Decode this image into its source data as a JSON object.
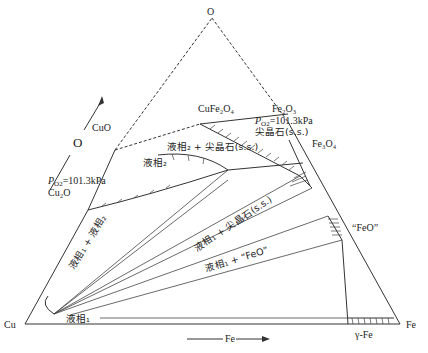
{
  "diagram": {
    "type": "ternary phase diagram",
    "vertices": {
      "top": "O",
      "left": "Cu",
      "right": "Fe"
    },
    "axis_arrows": {
      "left_side": "O",
      "bottom": "Fe"
    },
    "compounds": {
      "cuo": "CuO",
      "cu2o": "Cu₂O",
      "cufe2o4": "CuFe₂O₄",
      "fe2o3": "Fe₂O₃",
      "fe3o4": "Fe₃O₄",
      "feo": "“FeO”",
      "gamma_fe": "γ-Fe"
    },
    "pressure_labels": {
      "left": "P_O2=101.3kPa",
      "left_p": "P",
      "left_sub": "O2",
      "left_val": "=101.3kPa",
      "right_p": "P",
      "right_sub": "O2",
      "right_val": "=101.3kPa"
    },
    "regions": {
      "spinel_ss": "尖晶石(s.s.)",
      "liquid2_spinel": "液相₂ + 尖晶石(s.s.)",
      "liquid2": "液相₂",
      "liquid1_liquid2": "液相₁ + 液相₂",
      "liquid1_spinel": "液相₁ + 尖晶石(s.s.)",
      "liquid1_feo": "液相₁ + “FeO”",
      "liquid1": "液相₁"
    }
  }
}
